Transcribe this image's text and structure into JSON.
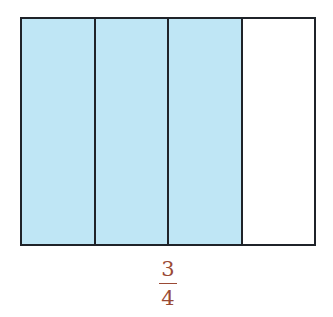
{
  "diagram": {
    "type": "fraction-model",
    "total_parts": 4,
    "shaded_parts": 3,
    "parts": [
      {
        "index": 1,
        "shaded": true
      },
      {
        "index": 2,
        "shaded": true
      },
      {
        "index": 3,
        "shaded": true
      },
      {
        "index": 4,
        "shaded": false
      }
    ],
    "colors": {
      "shaded": "#bfe6f5",
      "unshaded": "#ffffff",
      "outline": "#1f2329",
      "fraction_text": "#9a4a35"
    }
  },
  "fraction": {
    "numerator": "3",
    "denominator": "4"
  }
}
